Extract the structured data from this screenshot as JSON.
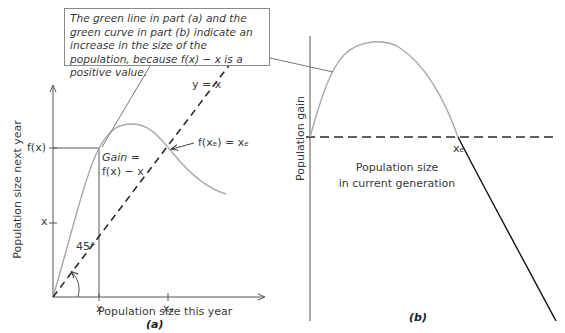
{
  "callout": {
    "text": "The green line in part (a) and the green curve in part (b) indicate an increase in the size of the population, because f(x) − x is a positive value."
  },
  "panel_a": {
    "ylabel": "Population size next year",
    "xlabel": "Population size this year",
    "caption": "(a)",
    "y_tick_fx": "f(x)",
    "y_tick_x": "x",
    "x_tick_x": "x",
    "x_tick_xe": "xₑ",
    "identity_line_label": "y = x",
    "gain_label_line1": "Gain =",
    "gain_label_line2": "f(x) − x",
    "equilibrium_label": "f(xₑ) = xₑ",
    "angle_label": "45°"
  },
  "panel_b": {
    "ylabel": "Population gain",
    "xlabel_line1": "Population size",
    "xlabel_line2": "in current generation",
    "x_tick_xe": "xₑ",
    "caption": "(b)"
  },
  "colors": {
    "curve": "#a8a8a8",
    "axis": "#3a3a3a",
    "dashed": "#2a2a2a",
    "decline": "#111111",
    "callout_border": "#8a8a8a"
  }
}
